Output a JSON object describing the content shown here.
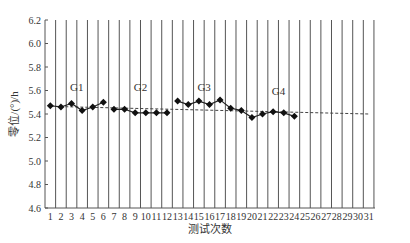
{
  "chart_data": {
    "type": "line",
    "title": "",
    "xlabel": "测试次数",
    "ylabel": "零位/(°)/h",
    "ylim": [
      4.6,
      6.2
    ],
    "yticks": [
      4.6,
      4.8,
      5.0,
      5.2,
      5.4,
      5.6,
      5.8,
      6.0,
      6.2
    ],
    "xticks": [
      1,
      2,
      3,
      4,
      5,
      6,
      7,
      8,
      9,
      10,
      11,
      12,
      13,
      14,
      15,
      16,
      17,
      18,
      19,
      20,
      21,
      22,
      23,
      24,
      25,
      26,
      27,
      28,
      29,
      30,
      31
    ],
    "grid": "vertical",
    "series": [
      {
        "name": "零位",
        "x": [
          1,
          2,
          3,
          4,
          5,
          6,
          7,
          8,
          9,
          10,
          11,
          12,
          13,
          14,
          15,
          16,
          17,
          18,
          19,
          20,
          21,
          22,
          23,
          24
        ],
        "values": [
          5.47,
          5.46,
          5.49,
          5.43,
          5.46,
          5.5,
          5.44,
          5.44,
          5.41,
          5.41,
          5.41,
          5.41,
          5.51,
          5.48,
          5.51,
          5.48,
          5.52,
          5.45,
          5.43,
          5.37,
          5.4,
          5.42,
          5.41,
          5.38
        ]
      }
    ],
    "trendline": {
      "x": [
        1,
        31
      ],
      "values": [
        5.465,
        5.4
      ],
      "style": "dashed"
    },
    "annotations": [
      {
        "text": "G1",
        "x": 3.5,
        "y": 5.6
      },
      {
        "text": "G2",
        "x": 9.5,
        "y": 5.6
      },
      {
        "text": "G3",
        "x": 15.5,
        "y": 5.6
      },
      {
        "text": "G4",
        "x": 22.5,
        "y": 5.56
      }
    ]
  }
}
